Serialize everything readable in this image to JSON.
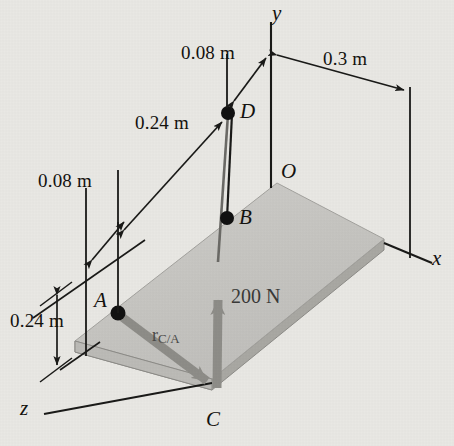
{
  "figure": {
    "background_color": "#e9e8e4",
    "line_color": "#1a1a18",
    "plate_top_color": "#c9c8c4",
    "plate_edge_color": "#a8a7a2",
    "vector_color": "#8e8d88"
  },
  "axes": [
    {
      "name": "y-axis",
      "label": "y"
    },
    {
      "name": "x-axis",
      "label": "x"
    },
    {
      "name": "z-axis",
      "label": "z"
    }
  ],
  "points": [
    {
      "name": "origin",
      "label": "O"
    },
    {
      "name": "point-d",
      "label": "D"
    },
    {
      "name": "point-b",
      "label": "B"
    },
    {
      "name": "point-a",
      "label": "A"
    },
    {
      "name": "point-c",
      "label": "C"
    }
  ],
  "dimensions": [
    {
      "name": "dim-008-top",
      "label": "0.08 m"
    },
    {
      "name": "dim-03-right",
      "label": "0.3 m"
    },
    {
      "name": "dim-024-upper",
      "label": "0.24 m"
    },
    {
      "name": "dim-008-left",
      "label": "0.08 m"
    },
    {
      "name": "dim-024-left",
      "label": "0.24 m"
    }
  ],
  "vectors": [
    {
      "name": "force-vector",
      "label": "200 N"
    },
    {
      "name": "position-vector",
      "label_main": "r",
      "label_sub": "C/A"
    }
  ]
}
